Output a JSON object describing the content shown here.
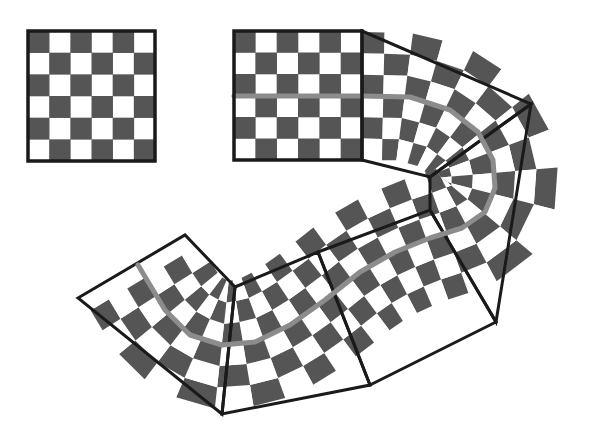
{
  "diagram": {
    "colors": {
      "background": "#ffffff",
      "dark_cell": "#555555",
      "light_cell": "#ffffff",
      "outline": "#1a1a1a",
      "path": "#8c8c8c"
    },
    "reference_board": {
      "x": 28,
      "y": 31,
      "width": 127,
      "height": 130,
      "cols": 6,
      "rows": 6
    },
    "straight_board": {
      "x": 234,
      "y": 31,
      "width": 128,
      "height": 129,
      "cols": 6,
      "rows": 6,
      "path_y": 96
    },
    "curved_region_polygons": [
      {
        "name": "top-segment",
        "points": [
          [
            362,
            31
          ],
          [
            531,
            104
          ],
          [
            430,
            177
          ],
          [
            362,
            160
          ]
        ]
      },
      {
        "name": "bend-segment",
        "points": [
          [
            430,
            177
          ],
          [
            531,
            104
          ],
          [
            496,
            322
          ],
          [
            430,
            210
          ]
        ]
      },
      {
        "name": "middle-right-segment",
        "points": [
          [
            318,
            252
          ],
          [
            430,
            210
          ],
          [
            496,
            322
          ],
          [
            370,
            385
          ]
        ]
      },
      {
        "name": "middle-left-segment",
        "points": [
          [
            235,
            287
          ],
          [
            318,
            252
          ],
          [
            370,
            385
          ],
          [
            222,
            414
          ]
        ]
      },
      {
        "name": "end-segment",
        "points": [
          [
            78,
            298
          ],
          [
            185,
            235
          ],
          [
            235,
            287
          ],
          [
            222,
            414
          ]
        ]
      }
    ],
    "path_points": [
      [
        234,
        96
      ],
      [
        362,
        96
      ],
      [
        410,
        97
      ],
      [
        450,
        110
      ],
      [
        478,
        132
      ],
      [
        493,
        160
      ],
      [
        495,
        188
      ],
      [
        485,
        212
      ],
      [
        462,
        228
      ],
      [
        430,
        238
      ],
      [
        395,
        252
      ],
      [
        360,
        272
      ],
      [
        325,
        300
      ],
      [
        290,
        325
      ],
      [
        255,
        342
      ],
      [
        222,
        345
      ],
      [
        190,
        335
      ],
      [
        165,
        310
      ],
      [
        150,
        285
      ],
      [
        138,
        265
      ]
    ]
  }
}
